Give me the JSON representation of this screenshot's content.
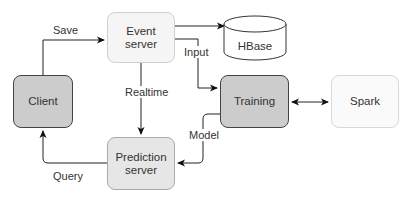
{
  "nodes": {
    "client": {
      "label": "Client",
      "fill": "#cccccc"
    },
    "event_server": {
      "label_line1": "Event",
      "label_line2": "server",
      "fill": "#f5f5f5"
    },
    "hbase": {
      "label": "HBase",
      "fill": "#ffffff"
    },
    "training": {
      "label": "Training",
      "fill": "#cccccc"
    },
    "spark": {
      "label": "Spark",
      "fill": "#fafafa"
    },
    "prediction_server": {
      "label_line1": "Prediction",
      "label_line2": "server",
      "fill": "#e6e6e6"
    }
  },
  "edges": {
    "save": "Save",
    "input": "Input",
    "realtime": "Realtime",
    "model": "Model",
    "query": "Query"
  }
}
